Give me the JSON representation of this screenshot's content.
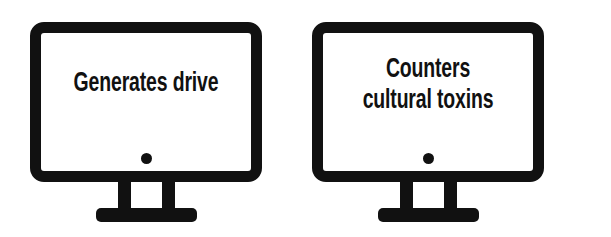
{
  "diagram": {
    "type": "two-monitor-icon-diagram",
    "background_color": "#ffffff",
    "stroke_color": "#111111",
    "monitors": [
      {
        "id": "monitor-left",
        "screen_text": "Generates drive",
        "icon": "monitor-icon",
        "power_dot": "power-indicator-dot"
      },
      {
        "id": "monitor-right",
        "screen_text": "Counters\ncultural toxins",
        "icon": "monitor-icon",
        "power_dot": "power-indicator-dot"
      }
    ]
  }
}
